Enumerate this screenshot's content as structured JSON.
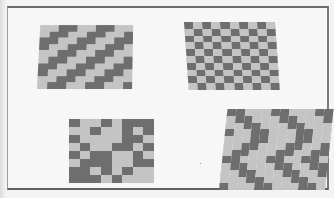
{
  "figure": {
    "colors": {
      "page_background": "#f4f4f4",
      "frame_border": "#6a6a6a",
      "dark_cell": "#6e6e6e",
      "light_cell": "#c4c4c4"
    },
    "panels": [
      {
        "id": "a",
        "name": "twill-diagonal",
        "position": "top-left",
        "pattern_type": "diagonal twill",
        "rows": 10,
        "cols": 10,
        "grid": [
          "LLDDLLDDLL",
          "LDDLLDDLLD",
          "DDLLDDLLDD",
          "DLLDDLLDDL",
          "LLDDLLDDLL",
          "LDDLLDDLLD",
          "DDLLDDLLDD",
          "DLLDDLLDDL",
          "LLDDLLDDLL",
          "LDDLLDDLLD"
        ]
      },
      {
        "id": "b",
        "name": "checkerboard",
        "position": "top-right",
        "pattern_type": "plain weave (checkerboard)",
        "rows": 10,
        "cols": 10,
        "grid": [
          "DLDLDLDLDL",
          "LDLDLDLDLD",
          "DLDLDLDLDL",
          "LDLDLDLDLD",
          "DLDLDLDLDL",
          "LDLDLDLDLD",
          "DLDLDLDLDL",
          "LDLDLDLDLD",
          "DLDLDLDLDL",
          "LDLDLDLDLD"
        ]
      },
      {
        "id": "c",
        "name": "block-weave",
        "position": "bottom-left",
        "pattern_type": "irregular block weave",
        "rows": 8,
        "cols": 8,
        "grid": [
          "DLLDLDDD",
          "LLDLLDLD",
          "DLLLLDDL",
          "LDLLDDLD",
          "DLDDLLDL",
          "LDDDLLDD",
          "DDLDLDLL",
          "DDDLDLLL"
        ]
      },
      {
        "id": "d",
        "name": "zigzag-twill",
        "position": "bottom-right",
        "pattern_type": "zigzag / herringbone twill",
        "rows": 12,
        "cols": 12,
        "grid": [
          "DDLLLDDLLLDD",
          "LDDLLLDDLLLD",
          "LLDDLLLDDLLL",
          "DLLDDLLLDDLL",
          "LLLDDLLLDDLL",
          "LLDDLLLDDLLD",
          "LDDLLLDDLLDD",
          "DDLLLDDLLDDL",
          "LDDLLLDDLLDD",
          "LLDDLLLDDLLD",
          "LLLDDLLLDDLL",
          "DLLLDDLLLDDL"
        ]
      }
    ]
  }
}
